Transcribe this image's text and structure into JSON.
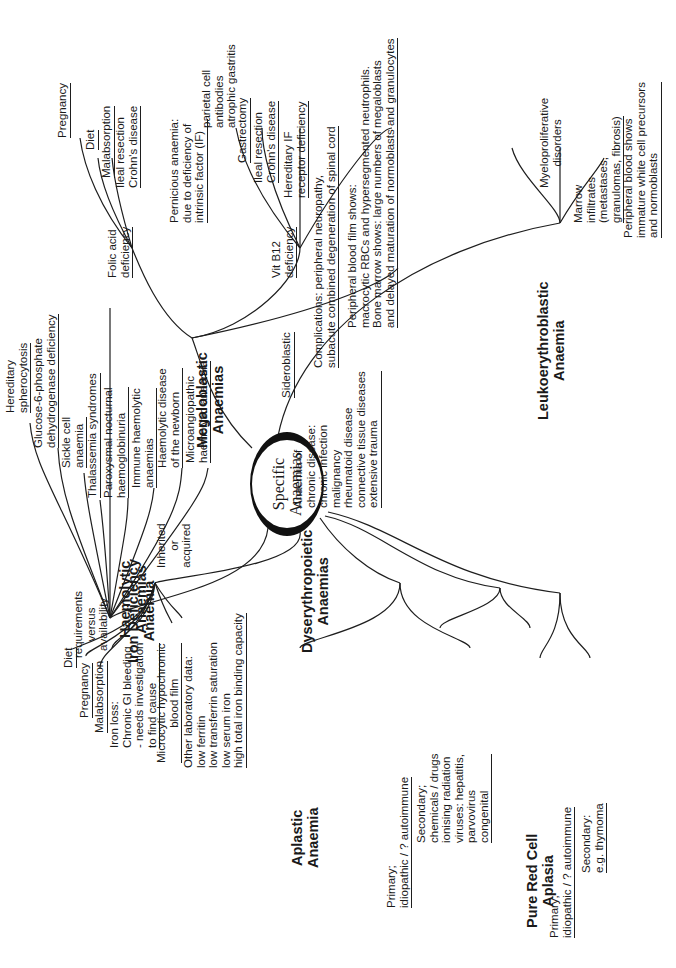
{
  "center": {
    "line1": "Specific",
    "line2": "Anaemias"
  },
  "colors": {
    "ink": "#1e1e1e",
    "background": "#ffffff"
  },
  "orientation": "rotated 90 degrees counter-clockwise",
  "branches": {
    "haemolytic": {
      "title": "Haemolytic\nAnaemias",
      "note": "Inherited\nor\nacquired",
      "items": [
        "Hereditary\nspherocytosis",
        "Glucose-6-phosphate\ndehydrogenase deficiency",
        "Sickle cell\nanaemia",
        "Thalassemia syndromes",
        "Paroxysmal nocturnal\nhaemoglobinuria",
        "Immune haemolytic\nanaemias",
        "Haemolytic disease\nof the newborn",
        "Microangiopathic\nhaemolytic anaemia"
      ]
    },
    "megaloblastic": {
      "title": "Megaloblastic\nAnaemias",
      "folic_acid": {
        "label": "Folic acid\ndeficiency",
        "items": [
          "Pregnancy",
          "Diet",
          "Malabsorption",
          "Ileal resection\nCrohn's disease"
        ]
      },
      "vit_b12": {
        "label": "Vit B12\ndeficiency",
        "pernicious": "Pernicious anaemia:\ndue to deficiency of\nintrinsic factor (IF)",
        "pernicious_note": "parietal cell\nantibodies\natrophic gastritis",
        "items": [
          "Gastrectomy",
          "Ileal resection\nCrohn's disease",
          "Hereditary IF\nreceptor deficiency",
          "Complications: peripheral neuropathy,\nsubacute combined degeneration of spinal cord"
        ]
      },
      "blood_film": "Peripheral blood film shows:\nmacrocytic RBCs and hypersegmented neutrophils.\nBone marrow shows: large numbers of megaloblasts\nand delayed maturation of normoblasts and granulocytes"
    },
    "leukoerythroblastic": {
      "title": "Leukoerythroblastic\nAnaemia",
      "items": [
        "Myeloproliferative\ndisorders",
        "Marrow\ninfiltrates\n(metastases,\ngranulomas, fibrosis)",
        "Peripheral blood shows\nimmature white cell precursors\nand normoblasts"
      ]
    },
    "iron_deficiency": {
      "title": "Iron Deficiency\nAnaemia",
      "note": "requirements\nversus\navailability",
      "items": [
        "Diet",
        "Pregnancy",
        "Malabsorption",
        "Iron loss:\nChronic GI bleeding\n- needs investigation\nto find cause",
        "Microcytic hypochromic\nblood film",
        "Other laboratory data:\nlow ferritin\nlow transferrin saturation\nlow serum iron\nhigh total iron binding capacity"
      ]
    },
    "dyserythropoietic": {
      "title": "Dyserythropoietic\nAnaemias",
      "items": [
        "Sideroblastic",
        "Anaemia of\nchronic disease:\nchronic infection\nmalignancy\nrheumatoid disease\nconnective tissue diseases\nextensive trauma"
      ]
    },
    "aplastic": {
      "title": "Aplastic\nAnaemia",
      "items": [
        "Primary;\nidiopathic / ? autoimmune",
        "Secondary;\nchemicals / drugs\nionising radiation\nviruses: hepatitis,\nparvovirus\ncongenital"
      ]
    },
    "pure_red_cell": {
      "title": "Pure Red Cell\nAplasia",
      "items": [
        "Primary;\nidiopathic / ? autoimmune",
        "Secondary:\ne.g. thymoma"
      ]
    }
  }
}
